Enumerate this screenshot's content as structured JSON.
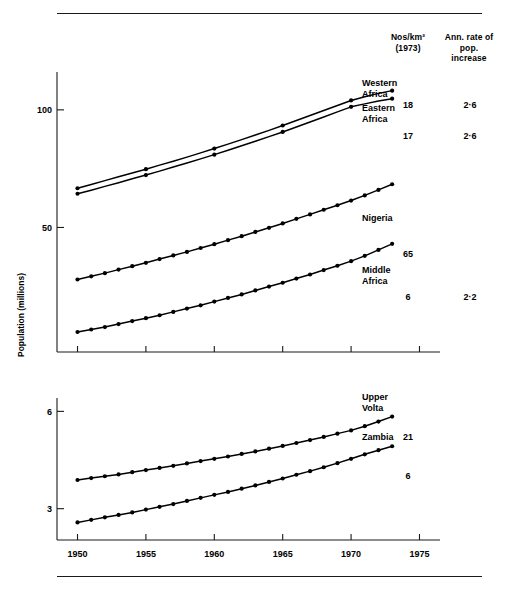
{
  "figure": {
    "y_axis_title": "Population (millions)",
    "columns": {
      "density_header": "Nos/km²\n(1973)",
      "rate_header": "Ann.\nrate of\npop.\nincrease"
    }
  },
  "chart_data": {
    "type": "line",
    "title": "",
    "xlabel": "",
    "ylabel": "Population (millions)",
    "scale": "log",
    "grid": false,
    "legend_position": "right-inline-labels",
    "x": [
      1950,
      1951,
      1952,
      1953,
      1954,
      1955,
      1956,
      1957,
      1958,
      1959,
      1960,
      1961,
      1962,
      1963,
      1964,
      1965,
      1966,
      1967,
      1968,
      1969,
      1970,
      1971,
      1972,
      1973
    ],
    "panels": [
      {
        "name": "upper-panel",
        "ylim": [
          24,
          125
        ],
        "yticks": [
          50,
          100
        ],
        "yticklabels": [
          "50",
          "100"
        ],
        "xlim": [
          1948.5,
          1976.5
        ],
        "xticks": [
          1950,
          1955,
          1960,
          1965,
          1970,
          1975
        ],
        "xticklabels": [
          "1950",
          "1955",
          "1960",
          "1965",
          "1970",
          "1975"
        ],
        "series": [
          {
            "name": "Western Africa",
            "label": "Western\nAfrica",
            "marker_interval": 5,
            "density_1973": "18",
            "annual_rate": "2·6",
            "values": [
              63.0,
              64.4,
              65.9,
              67.4,
              68.9,
              70.5,
              72.2,
              73.9,
              75.7,
              77.6,
              79.6,
              81.7,
              83.9,
              86.2,
              88.6,
              91.2,
              93.9,
              96.7,
              99.6,
              102.6,
              105.7,
              108.0,
              110.2,
              112.0
            ]
          },
          {
            "name": "Eastern Africa",
            "label": "Eastern\nAfrica",
            "marker_interval": 5,
            "density_1973": "17",
            "annual_rate": "2·6",
            "values": [
              61.0,
              62.3,
              63.7,
              65.1,
              66.6,
              68.1,
              69.7,
              71.4,
              73.1,
              74.9,
              76.8,
              78.8,
              80.9,
              83.1,
              85.4,
              87.8,
              90.4,
              93.1,
              95.9,
              98.8,
              101.8,
              103.6,
              105.3,
              106.8
            ]
          },
          {
            "name": "Nigeria",
            "label": "Nigeria",
            "marker_interval": 1,
            "density_1973": "65",
            "annual_rate": "",
            "values": [
              36.8,
              37.5,
              38.2,
              39.0,
              39.8,
              40.6,
              41.5,
              42.4,
              43.3,
              44.3,
              45.3,
              46.4,
              47.5,
              48.7,
              49.9,
              51.2,
              52.6,
              54.0,
              55.5,
              57.0,
              58.6,
              60.4,
              62.4,
              64.5
            ]
          },
          {
            "name": "Middle Africa",
            "label": "Middle\nAfrica",
            "marker_interval": 1,
            "density_1973": "6",
            "annual_rate": "2·2",
            "values": [
              27.0,
              27.4,
              27.8,
              28.3,
              28.8,
              29.3,
              29.8,
              30.4,
              31.0,
              31.6,
              32.3,
              33.0,
              33.7,
              34.5,
              35.3,
              36.1,
              37.0,
              37.9,
              38.9,
              39.9,
              41.0,
              42.3,
              43.8,
              45.4
            ]
          }
        ]
      },
      {
        "name": "lower-panel",
        "ylim": [
          2.4,
          6.6
        ],
        "yticks": [
          3,
          6
        ],
        "yticklabels": [
          "3",
          "6"
        ],
        "xlim": [
          1948.5,
          1976.5
        ],
        "xticks": [
          1950,
          1955,
          1960,
          1965,
          1970,
          1975
        ],
        "xticklabels": [
          "1950",
          "1955",
          "1960",
          "1965",
          "1970",
          "1975"
        ],
        "series": [
          {
            "name": "Upper Volta",
            "label": "Upper\nVolta",
            "marker_interval": 1,
            "density_1973": "21",
            "annual_rate": "",
            "values": [
              3.68,
              3.73,
              3.78,
              3.83,
              3.89,
              3.95,
              4.01,
              4.07,
              4.14,
              4.21,
              4.28,
              4.35,
              4.43,
              4.51,
              4.6,
              4.69,
              4.79,
              4.89,
              5.0,
              5.12,
              5.24,
              5.4,
              5.58,
              5.78
            ]
          },
          {
            "name": "Zambia",
            "label": "Zambia",
            "marker_interval": 1,
            "density_1973": "6",
            "annual_rate": "",
            "values": [
              2.72,
              2.77,
              2.82,
              2.87,
              2.92,
              2.98,
              3.04,
              3.1,
              3.17,
              3.24,
              3.31,
              3.38,
              3.46,
              3.54,
              3.63,
              3.72,
              3.82,
              3.92,
              4.03,
              4.15,
              4.28,
              4.42,
              4.55,
              4.68
            ]
          }
        ]
      }
    ]
  },
  "annotations": {
    "western_africa_label": "Western\nAfrica",
    "eastern_africa_label": "Eastern\nAfrica",
    "nigeria_label": "Nigeria",
    "middle_africa_label": "Middle\nAfrica",
    "upper_volta_label": "Upper\nVolta",
    "zambia_label": "Zambia",
    "density_values": {
      "western_africa": "18",
      "eastern_africa": "17",
      "nigeria": "65",
      "middle_africa": "6",
      "upper_volta": "21",
      "zambia": "6"
    },
    "rate_values": {
      "western_africa": "2·6",
      "eastern_africa": "2·6",
      "middle_africa": "2·2"
    }
  }
}
